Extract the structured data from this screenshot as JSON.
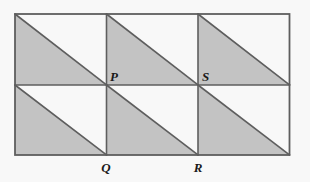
{
  "figure": {
    "grid": {
      "columns": 3,
      "rows": 2,
      "cell_width": 91.5,
      "cell_height": 70.5
    },
    "outer_rect": {
      "x": 15,
      "y": 14,
      "width": 274.5,
      "height": 141
    },
    "colors": {
      "background": "#f8f8f8",
      "shade_fill": "#c3c3c3",
      "stroke": "#5e5e5e",
      "label_text": "#1a1a1a"
    },
    "stroke_width": 1.6,
    "cells": [
      {
        "id": "cell-r1c1",
        "row": 0,
        "col": 0,
        "shaded_half": "lower-left"
      },
      {
        "id": "cell-r1c2",
        "row": 0,
        "col": 1,
        "shaded_half": "lower-left"
      },
      {
        "id": "cell-r1c3",
        "row": 0,
        "col": 2,
        "shaded_half": "lower-left"
      },
      {
        "id": "cell-r2c1",
        "row": 1,
        "col": 0,
        "shaded_half": "lower-left"
      },
      {
        "id": "cell-r2c2",
        "row": 1,
        "col": 1,
        "shaded_half": "lower-left"
      },
      {
        "id": "cell-r2c3",
        "row": 1,
        "col": 2,
        "shaded_half": "lower-left"
      }
    ],
    "labels": [
      {
        "id": "label-P",
        "text": "P",
        "x": 110,
        "y": 81,
        "anchor": "start"
      },
      {
        "id": "label-S",
        "text": "S",
        "x": 202,
        "y": 81,
        "anchor": "start"
      },
      {
        "id": "label-Q",
        "text": "Q",
        "x": 106,
        "y": 172,
        "anchor": "middle"
      },
      {
        "id": "label-R",
        "text": "R",
        "x": 198,
        "y": 172,
        "anchor": "middle"
      }
    ]
  }
}
